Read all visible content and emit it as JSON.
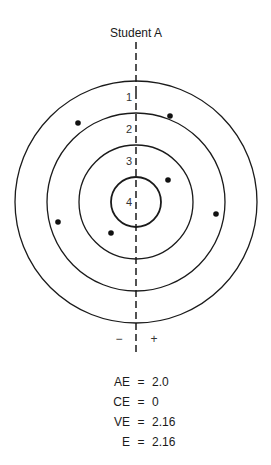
{
  "title": "Student A",
  "rings": [
    {
      "label": "1",
      "radius": 121
    },
    {
      "label": "2",
      "radius": 89
    },
    {
      "label": "3",
      "radius": 57
    },
    {
      "label": "4",
      "radius": 25
    }
  ],
  "axis_signs": {
    "left": "−",
    "right": "+"
  },
  "hits": [
    {
      "x": 78,
      "y": 123
    },
    {
      "x": 170,
      "y": 116
    },
    {
      "x": 168,
      "y": 180
    },
    {
      "x": 216,
      "y": 214
    },
    {
      "x": 58,
      "y": 222
    },
    {
      "x": 111,
      "y": 233
    }
  ],
  "stats": [
    {
      "key": "AE",
      "eq": "=",
      "value": "2.0"
    },
    {
      "key": "CE",
      "eq": "=",
      "value": "0"
    },
    {
      "key": "VE",
      "eq": "=",
      "value": "2.16"
    },
    {
      "key": "E",
      "eq": "=",
      "value": "2.16"
    }
  ]
}
